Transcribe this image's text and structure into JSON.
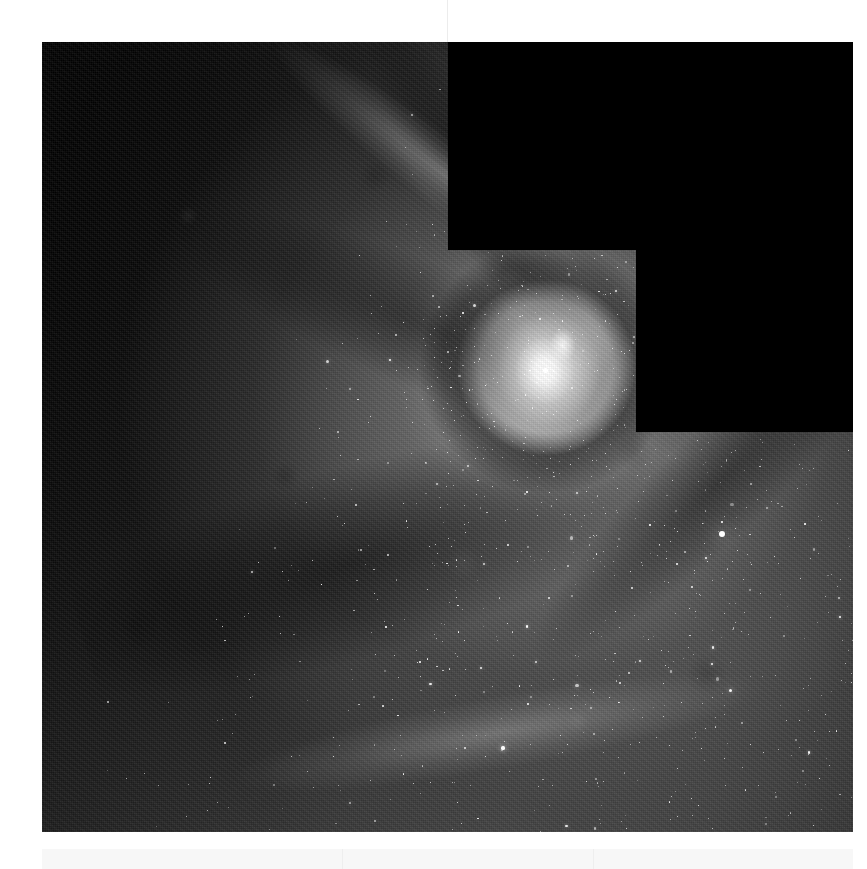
{
  "page": {
    "background_color": "#ffffff",
    "width": 867,
    "height": 869
  },
  "viewer": {
    "title": "Astronomical Image Viewer",
    "image_alt": "Grayscale space telescope mosaic of a barred spiral galaxy nucleus with dust lanes and star clusters",
    "instrument_note": "WFPC2-style mosaic with stair-step detector chip gaps",
    "colormap": "grayscale",
    "frame": {
      "left": 42,
      "top": 42,
      "width": 811,
      "height": 790,
      "border_color": "#000000"
    }
  },
  "chart_data": {
    "type": "heatmap",
    "title": "",
    "xlabel": "",
    "ylabel": "",
    "colormap": "grayscale",
    "grid": false,
    "legend": "none",
    "xlim": [
      0,
      811
    ],
    "ylim": [
      0,
      790
    ],
    "background_level": "#050505",
    "features": [
      {
        "name": "galaxy-nucleus",
        "x": 503,
        "y": 328,
        "peak_brightness": 255,
        "label": "bright unresolved core"
      },
      {
        "name": "nuclear-ring",
        "x": 503,
        "y": 328,
        "radius": 126,
        "mean_brightness": 40,
        "label": "dark circumnuclear dust ring"
      },
      {
        "name": "inner-spiral-arm",
        "x": 420,
        "y": 440,
        "mean_brightness": 120,
        "label": "inner arm with knots"
      },
      {
        "name": "outer-arm-southeast",
        "x": 660,
        "y": 560,
        "mean_brightness": 105,
        "label": "star-forming arm ridge"
      },
      {
        "name": "dust-lane-north",
        "x": 250,
        "y": 180,
        "mean_brightness": 18,
        "label": "dark dust lane"
      },
      {
        "name": "dust-lane-south",
        "x": 330,
        "y": 640,
        "mean_brightness": 22,
        "label": "dark dust lane"
      },
      {
        "name": "field-star-bright",
        "x": 680,
        "y": 492,
        "peak_brightness": 250,
        "label": "foreground star"
      }
    ],
    "chip_gaps": [
      {
        "name": "chip-gap-upper",
        "x": 406,
        "y": 0,
        "width": 405,
        "height": 208,
        "value": 0
      },
      {
        "name": "chip-gap-right",
        "x": 594,
        "y": 208,
        "width": 217,
        "height": 182,
        "value": 0
      }
    ],
    "intensity_scale": {
      "min": 0,
      "max": 255,
      "unit": "8-bit grey level"
    }
  }
}
